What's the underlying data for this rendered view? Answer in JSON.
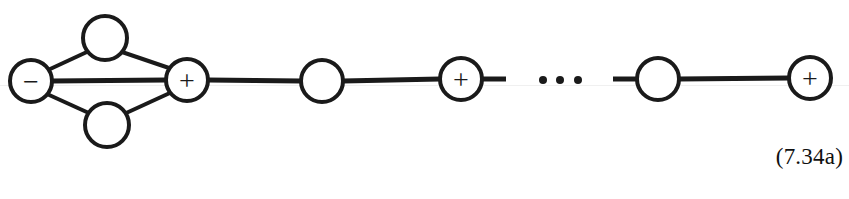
{
  "figure": {
    "type": "graph-diagram",
    "caption_label": "(7.34a)",
    "background_color": "#ffffff",
    "stroke_color": "#1a1a1a",
    "canvas": {
      "width": 849,
      "height": 199
    },
    "nodes": [
      {
        "id": "n1",
        "label": "−",
        "label_name": "minus-sign",
        "cx": 31,
        "cy": 81,
        "r": 21
      },
      {
        "id": "n2",
        "label": "",
        "label_name": "empty",
        "cx": 105,
        "cy": 38,
        "r": 22
      },
      {
        "id": "n3",
        "label": "",
        "label_name": "empty",
        "cx": 107,
        "cy": 125,
        "r": 22
      },
      {
        "id": "n4",
        "label": "+",
        "label_name": "plus-sign",
        "cx": 187,
        "cy": 80,
        "r": 21
      },
      {
        "id": "n5",
        "label": "",
        "label_name": "empty",
        "cx": 322,
        "cy": 81,
        "r": 21
      },
      {
        "id": "n6",
        "label": "+",
        "label_name": "plus-sign",
        "cx": 461,
        "cy": 79,
        "r": 21
      },
      {
        "id": "n7",
        "label": "",
        "label_name": "empty",
        "cx": 658,
        "cy": 79,
        "r": 21
      },
      {
        "id": "n8",
        "label": "+",
        "label_name": "plus-sign",
        "cx": 810,
        "cy": 78,
        "r": 21
      }
    ],
    "edges": [
      {
        "from": "n1",
        "to": "n2",
        "x1": 48,
        "y1": 70,
        "x2": 89,
        "y2": 51,
        "width": 4
      },
      {
        "from": "n2",
        "to": "n4",
        "x1": 122,
        "y1": 52,
        "x2": 172,
        "y2": 69,
        "width": 4
      },
      {
        "from": "n1",
        "to": "n4",
        "x1": 52,
        "y1": 81,
        "x2": 166,
        "y2": 80,
        "width": 5
      },
      {
        "from": "n1",
        "to": "n3",
        "x1": 47,
        "y1": 94,
        "x2": 91,
        "y2": 114,
        "width": 4
      },
      {
        "from": "n3",
        "to": "n4",
        "x1": 124,
        "y1": 114,
        "x2": 172,
        "y2": 92,
        "width": 4
      },
      {
        "from": "n4",
        "to": "n5",
        "x1": 208,
        "y1": 80,
        "x2": 301,
        "y2": 81,
        "width": 5
      },
      {
        "from": "n5",
        "to": "n6",
        "x1": 343,
        "y1": 81,
        "x2": 440,
        "y2": 79,
        "width": 5
      },
      {
        "from": "n7",
        "to": "n8",
        "x1": 679,
        "y1": 79,
        "x2": 789,
        "y2": 78,
        "width": 5
      }
    ],
    "stubs": [
      {
        "name": "stub-after-plus-node-6",
        "x1": 482,
        "y1": 79,
        "x2": 506,
        "y2": 79,
        "width": 5
      },
      {
        "name": "stub-before-node-7",
        "x1": 613,
        "y1": 79,
        "x2": 637,
        "y2": 79,
        "width": 5
      }
    ],
    "ellipsis": {
      "name": "chain-ellipsis",
      "dots": [
        {
          "cx": 543,
          "cy": 80,
          "r": 4
        },
        {
          "cx": 560,
          "cy": 80,
          "r": 4
        },
        {
          "cx": 578,
          "cy": 80,
          "r": 4
        }
      ]
    }
  }
}
